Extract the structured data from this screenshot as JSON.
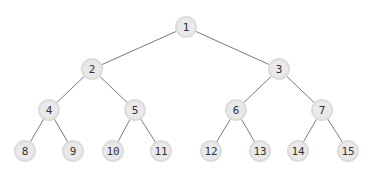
{
  "diagram": {
    "type": "binary-tree",
    "nodes": [
      {
        "id": "1",
        "label": "1"
      },
      {
        "id": "2",
        "label": "2"
      },
      {
        "id": "3",
        "label": "3"
      },
      {
        "id": "4",
        "label": "4"
      },
      {
        "id": "5",
        "label": "5"
      },
      {
        "id": "6",
        "label": "6"
      },
      {
        "id": "7",
        "label": "7"
      },
      {
        "id": "8",
        "label": "8"
      },
      {
        "id": "9",
        "label": "9"
      },
      {
        "id": "10",
        "label": "10"
      },
      {
        "id": "11",
        "label": "11"
      },
      {
        "id": "12",
        "label": "12"
      },
      {
        "id": "13",
        "label": "13"
      },
      {
        "id": "14",
        "label": "14"
      },
      {
        "id": "15",
        "label": "15"
      }
    ],
    "edges": [
      {
        "from": "1",
        "to": "2"
      },
      {
        "from": "1",
        "to": "3"
      },
      {
        "from": "2",
        "to": "4"
      },
      {
        "from": "2",
        "to": "5"
      },
      {
        "from": "3",
        "to": "6"
      },
      {
        "from": "3",
        "to": "7"
      },
      {
        "from": "4",
        "to": "8"
      },
      {
        "from": "4",
        "to": "9"
      },
      {
        "from": "5",
        "to": "10"
      },
      {
        "from": "5",
        "to": "11"
      },
      {
        "from": "6",
        "to": "12"
      },
      {
        "from": "6",
        "to": "13"
      },
      {
        "from": "7",
        "to": "14"
      },
      {
        "from": "7",
        "to": "15"
      }
    ]
  }
}
